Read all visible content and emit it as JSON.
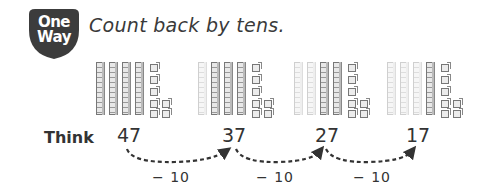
{
  "badge": {
    "line1": "One",
    "line2": "Way",
    "color": "#3c3c3c"
  },
  "instruction": "Count back by tens.",
  "groups": [
    {
      "value": 47,
      "tens_total": 4,
      "tens_faded": 0,
      "ones": 7
    },
    {
      "value": 37,
      "tens_total": 4,
      "tens_faded": 1,
      "ones": 7
    },
    {
      "value": 27,
      "tens_total": 4,
      "tens_faded": 2,
      "ones": 7
    },
    {
      "value": 17,
      "tens_total": 4,
      "tens_faded": 3,
      "ones": 7
    }
  ],
  "think": {
    "label": "Think",
    "numbers": [
      "47",
      "37",
      "27",
      "17"
    ],
    "steps": [
      "− 10",
      "− 10",
      "− 10"
    ]
  }
}
